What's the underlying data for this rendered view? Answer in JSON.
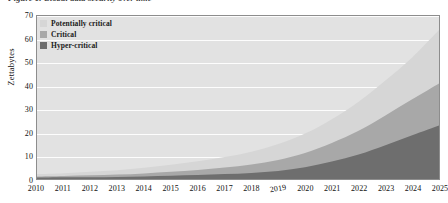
{
  "figure": {
    "caption": "Figure 1. Global data security over time"
  },
  "legend": {
    "position": "top-left",
    "items": [
      {
        "label": "Potentially critical",
        "color": "#d6d6d6",
        "icon": "legend-swatch"
      },
      {
        "label": "Critical",
        "color": "#a8a8a8",
        "icon": "legend-swatch"
      },
      {
        "label": "Hyper-critical",
        "color": "#6e6e6e",
        "icon": "legend-swatch"
      }
    ]
  },
  "axes": {
    "ylabel": "Zettabytes",
    "yticks": [
      "0",
      "10",
      "20",
      "30",
      "40",
      "50",
      "60",
      "70"
    ],
    "xticks": [
      "2010",
      "2011",
      "2012",
      "2013",
      "2014",
      "2015",
      "2016",
      "2017",
      "2018",
      "2019",
      "2020",
      "2021",
      "2022",
      "2023",
      "2024",
      "2025"
    ]
  },
  "colors": {
    "plot_background": "#e2e2e2",
    "gridline": "#fdfdfd",
    "frame": "#8d8d8d",
    "potentially_critical": "#d6d6d6",
    "critical": "#a8a8a8",
    "hyper_critical": "#6e6e6e"
  },
  "chart_data": {
    "type": "area",
    "stacked": true,
    "title": "Figure 1. Global data security over time",
    "xlabel": "",
    "ylabel": "Zettabytes",
    "xlim": [
      2010,
      2025
    ],
    "ylim": [
      0,
      70
    ],
    "grid": true,
    "legend_position": "top-left",
    "categories": [
      2010,
      2011,
      2012,
      2013,
      2014,
      2015,
      2016,
      2017,
      2018,
      2019,
      2020,
      2021,
      2022,
      2023,
      2024,
      2025
    ],
    "series": [
      {
        "name": "Hyper-critical",
        "color": "#6e6e6e",
        "values": [
          0.6,
          0.7,
          0.8,
          0.9,
          1.1,
          1.4,
          1.7,
          2.1,
          2.6,
          3.4,
          5.0,
          7.5,
          10.5,
          14.5,
          18.8,
          23.0
        ]
      },
      {
        "name": "Critical",
        "color": "#a8a8a8",
        "values": [
          0.5,
          0.6,
          0.8,
          1.0,
          1.3,
          1.7,
          2.2,
          2.8,
          3.6,
          4.8,
          6.2,
          8.0,
          10.2,
          12.8,
          15.4,
          18.0
        ]
      },
      {
        "name": "Potentially critical",
        "color": "#d6d6d6",
        "values": [
          1.0,
          1.2,
          1.5,
          1.9,
          2.4,
          3.0,
          3.7,
          4.5,
          5.5,
          6.8,
          8.3,
          10.2,
          12.5,
          15.0,
          18.0,
          23.0
        ]
      }
    ],
    "totals": [
      2.1,
      2.5,
      3.1,
      3.8,
      4.8,
      6.1,
      7.6,
      9.4,
      11.7,
      15.0,
      19.5,
      25.7,
      33.2,
      42.3,
      52.2,
      64.0
    ]
  }
}
